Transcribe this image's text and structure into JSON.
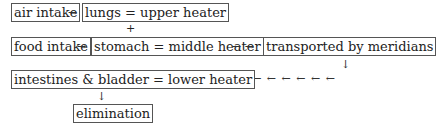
{
  "diagram": {
    "boxes": {
      "air_intake": "air intake",
      "lungs": "lungs = upper heater",
      "food_intake": "food intake",
      "stomach": "stomach = middle heater",
      "meridians": "transported by meridians",
      "lower": "intestines & bladder = lower heater",
      "elimination": "elimination"
    },
    "symbols": {
      "right_arrow": "→",
      "double_right_arrow": "→ →",
      "plus": "+",
      "down_arrow": "↓",
      "left_arrows": "← ← ← ← ← ← ← ← ←"
    }
  }
}
